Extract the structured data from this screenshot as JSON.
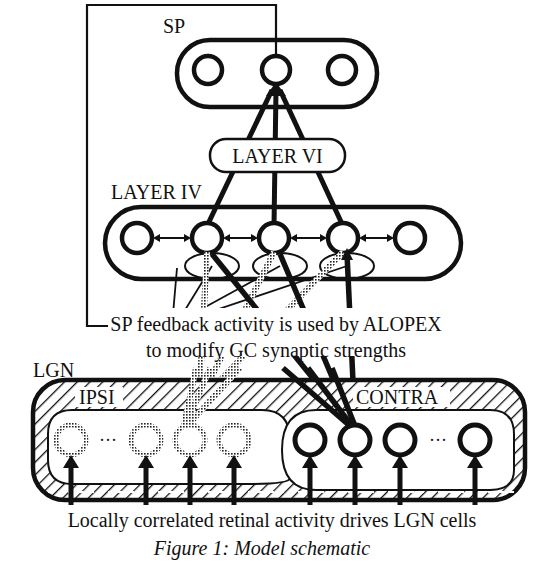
{
  "figure": {
    "caption": "Figure 1:  Model schematic",
    "colors": {
      "ink": "#111111",
      "background": "#ffffff",
      "stipple": "#555555"
    }
  },
  "labels": {
    "sp": "SP",
    "layer_vi": "LAYER VI",
    "layer_iv": "LAYER IV",
    "lgn": "LGN",
    "ipsi": "IPSI",
    "contra": "CONTRA",
    "feedback_line1": "SP feedback activity is used by ALOPEX",
    "feedback_line2": "to modify GC synaptic strengths",
    "retina_caption": "Locally correlated retinal activity drives LGN cells",
    "ellipsis": "···"
  },
  "nodes": {
    "sp_neurons": 3,
    "layer_iv_neurons": 5,
    "lgn_ipsi_neurons": 4,
    "lgn_contra_neurons": 4
  }
}
